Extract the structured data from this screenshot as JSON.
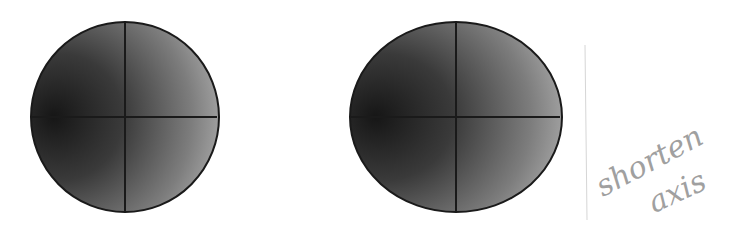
{
  "figures": [
    {
      "id": "circle",
      "shape": "circle",
      "center": [
        125,
        117
      ],
      "rx": 94,
      "ry": 95,
      "fill_gradient": [
        "#1c1c1c",
        "#4a4a4a",
        "#bdbdbd"
      ],
      "stroke": "#1a1a1a",
      "axes": {
        "horizontal": true,
        "vertical": true
      }
    },
    {
      "id": "ellipse",
      "shape": "ellipse",
      "center": [
        456,
        117
      ],
      "rx": 106,
      "ry": 95,
      "fill_gradient": [
        "#1c1c1c",
        "#4a4a4a",
        "#bdbdbd"
      ],
      "stroke": "#1a1a1a",
      "axes": {
        "horizontal": true,
        "vertical": true
      }
    }
  ],
  "annotation": {
    "line1": "shorten",
    "line2": "axis",
    "color": "#9a9a9a"
  }
}
